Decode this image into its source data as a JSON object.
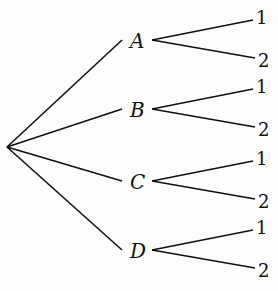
{
  "diagram": {
    "type": "tree",
    "root": {
      "x": 7,
      "y": 147
    },
    "nodes": [
      {
        "label": "A",
        "x": 138,
        "y": 40,
        "children": [
          "1",
          "2"
        ]
      },
      {
        "label": "B",
        "x": 138,
        "y": 109,
        "children": [
          "1",
          "2"
        ]
      },
      {
        "label": "C",
        "x": 138,
        "y": 181,
        "children": [
          "1",
          "2"
        ]
      },
      {
        "label": "D",
        "x": 138,
        "y": 250,
        "children": [
          "1",
          "2"
        ]
      }
    ],
    "line_color": "#111111"
  }
}
